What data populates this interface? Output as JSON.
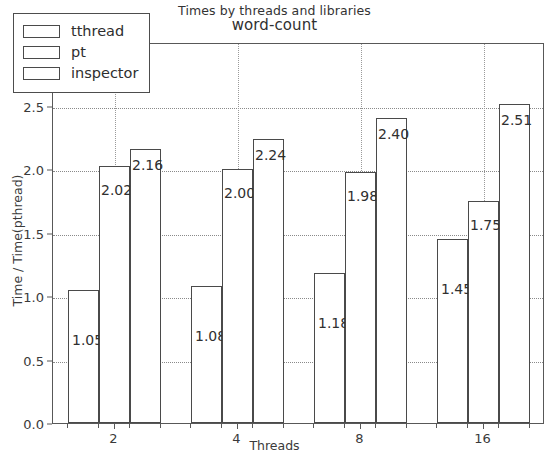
{
  "chart_data": {
    "type": "bar",
    "title": "Times by threads and libraries",
    "subtitle": "word-count",
    "xlabel": "Threads",
    "ylabel": "Time / Time(pthread)",
    "categories": [
      "2",
      "4",
      "8",
      "16"
    ],
    "series": [
      {
        "name": "tthread",
        "values": [
          1.05,
          1.08,
          1.18,
          1.45
        ],
        "labels": [
          "1.05",
          "1.08",
          "1.18",
          "1.45"
        ]
      },
      {
        "name": "pt",
        "values": [
          2.02,
          2.0,
          1.98,
          1.75
        ],
        "labels": [
          "2.02",
          "2.00",
          "1.98",
          "1.75"
        ]
      },
      {
        "name": "inspector",
        "values": [
          2.16,
          2.24,
          2.4,
          2.51
        ],
        "labels": [
          "2.16",
          "2.24",
          "2.40",
          "2.51"
        ]
      }
    ],
    "ylim": [
      0.0,
      3.0
    ],
    "yticks": [
      "0.0",
      "0.5",
      "1.0",
      "1.5",
      "2.0",
      "2.5",
      "3.0"
    ],
    "ytick_values": [
      0.0,
      0.5,
      1.0,
      1.5,
      2.0,
      2.5,
      3.0
    ],
    "xticks": [
      "2",
      "4",
      "8",
      "16"
    ],
    "grid": true,
    "legend_position": "upper left",
    "bar_face_color": "#ffffff",
    "bar_edge_color": "#4a4a4a",
    "grid_color": "#8a8a8a",
    "axis_color": "#585858",
    "text_color": "#303030"
  },
  "legend": {
    "entries": [
      "tthread",
      "pt",
      "inspector"
    ]
  }
}
